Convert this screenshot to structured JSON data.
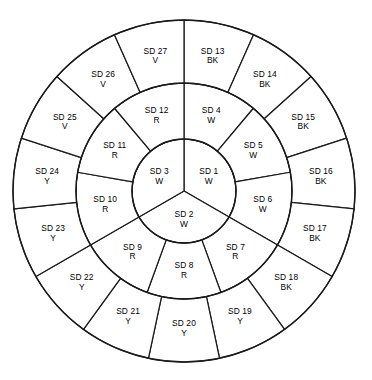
{
  "diagram": {
    "type": "concentric-ring-sector-wheel",
    "center": {
      "x": 184,
      "y": 191
    },
    "radii": {
      "inner": 52,
      "middle": 108,
      "outer": 171
    },
    "start_angle_deg": -90,
    "direction": "clockwise",
    "stroke_color": "#1a1a1a",
    "fill_color": "#ffffff",
    "text_color": "#000000",
    "color_legend": {
      "W": "White",
      "R": "Red",
      "Y": "Yellow",
      "BK": "Black",
      "V": "Violet"
    },
    "rings": [
      {
        "name": "inner-ring",
        "ring_index": 0,
        "sector_count": 3,
        "r_start": 0,
        "r_end": 52,
        "sectors": [
          {
            "code": "SD 1",
            "color": "W"
          },
          {
            "code": "SD 2",
            "color": "W"
          },
          {
            "code": "SD 3",
            "color": "W"
          }
        ]
      },
      {
        "name": "middle-ring",
        "ring_index": 1,
        "sector_count": 9,
        "r_start": 52,
        "r_end": 108,
        "sectors": [
          {
            "code": "SD 4",
            "color": "W"
          },
          {
            "code": "SD 5",
            "color": "W"
          },
          {
            "code": "SD 6",
            "color": "W"
          },
          {
            "code": "SD 7",
            "color": "R"
          },
          {
            "code": "SD 8",
            "color": "R"
          },
          {
            "code": "SD 9",
            "color": "R"
          },
          {
            "code": "SD 10",
            "color": "R"
          },
          {
            "code": "SD 11",
            "color": "R"
          },
          {
            "code": "SD 12",
            "color": "R"
          }
        ]
      },
      {
        "name": "outer-ring",
        "ring_index": 2,
        "sector_count": 15,
        "r_start": 108,
        "r_end": 171,
        "sectors": [
          {
            "code": "SD 13",
            "color": "BK"
          },
          {
            "code": "SD 14",
            "color": "BK"
          },
          {
            "code": "SD 15",
            "color": "BK"
          },
          {
            "code": "SD 16",
            "color": "BK"
          },
          {
            "code": "SD 17",
            "color": "BK"
          },
          {
            "code": "SD 18",
            "color": "BK"
          },
          {
            "code": "SD 19",
            "color": "Y"
          },
          {
            "code": "SD 20",
            "color": "Y"
          },
          {
            "code": "SD 21",
            "color": "Y"
          },
          {
            "code": "SD 22",
            "color": "Y"
          },
          {
            "code": "SD 23",
            "color": "Y"
          },
          {
            "code": "SD 24",
            "color": "Y"
          },
          {
            "code": "SD 25",
            "color": "V"
          },
          {
            "code": "SD 26",
            "color": "V"
          },
          {
            "code": "SD 27",
            "color": "V"
          }
        ]
      }
    ]
  }
}
